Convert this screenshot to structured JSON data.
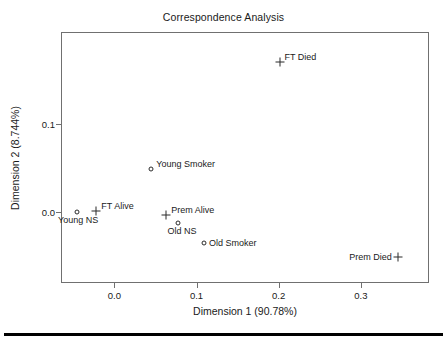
{
  "chart_data": {
    "type": "scatter",
    "title": "Correspondence Analysis",
    "xlabel": "Dimension 1 (90.78%)",
    "ylabel": "Dimension 2 (8.744%)",
    "xlim": [
      -0.065,
      0.383
    ],
    "ylim": [
      -0.081,
      0.205
    ],
    "xticks": [
      0.0,
      0.1,
      0.2,
      0.3
    ],
    "xtick_labels": [
      "0.0",
      "0.1",
      "0.2",
      "0.3"
    ],
    "yticks": [
      0.0,
      0.1
    ],
    "ytick_labels": [
      "0.0",
      "0.1"
    ],
    "grid": false,
    "legend": "none",
    "points": [
      {
        "label": "FT Died",
        "x": 0.201,
        "y": 0.171,
        "marker": "plus",
        "label_pos": "right-top"
      },
      {
        "label": "Young Smoker",
        "x": 0.045,
        "y": 0.049,
        "marker": "circle",
        "label_pos": "right-top"
      },
      {
        "label": "Young NS",
        "x": -0.046,
        "y": 0.0,
        "marker": "circle",
        "label_pos": "below-c"
      },
      {
        "label": "FT Alive",
        "x": -0.022,
        "y": 0.001,
        "marker": "plus",
        "label_pos": "right-top"
      },
      {
        "label": "Prem Alive",
        "x": 0.063,
        "y": -0.004,
        "marker": "plus",
        "label_pos": "right-top"
      },
      {
        "label": "Old NS",
        "x": 0.078,
        "y": -0.013,
        "marker": "circle",
        "label_pos": "below"
      },
      {
        "label": "Old Smoker",
        "x": 0.109,
        "y": -0.035,
        "marker": "circle",
        "label_pos": "right-mid"
      },
      {
        "label": "Prem Died",
        "x": 0.345,
        "y": -0.051,
        "marker": "plus",
        "label_pos": "left-mid"
      }
    ]
  },
  "style": {
    "frame_color": "#707070",
    "marker_color": "#2b2b2b",
    "text_color": "#1a1a1a",
    "rule_color": "#000000",
    "background": "#ffffff"
  }
}
